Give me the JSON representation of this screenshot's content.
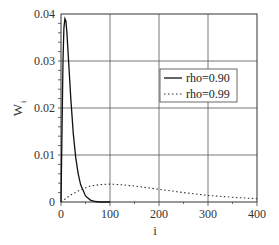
{
  "chart_data": {
    "type": "line",
    "title": "",
    "xlabel": "i",
    "ylabel": "W_i",
    "xlim": [
      0,
      400
    ],
    "ylim": [
      0,
      0.04
    ],
    "grid": true,
    "legend_position": "center-right",
    "x_ticks": [
      "0",
      "100",
      "200",
      "300",
      "400"
    ],
    "y_ticks": [
      "0",
      "0.01",
      "0.02",
      "0.03",
      "0.04"
    ],
    "series": [
      {
        "name": "rho=0.90",
        "style": "solid",
        "x": [
          0,
          2,
          4,
          6,
          8,
          10,
          12,
          15,
          20,
          25,
          30,
          35,
          40,
          50,
          60,
          70,
          80,
          90,
          100
        ],
        "values": [
          0.0,
          0.015,
          0.03,
          0.037,
          0.039,
          0.0385,
          0.036,
          0.031,
          0.022,
          0.0145,
          0.0095,
          0.006,
          0.0037,
          0.0013,
          0.0004,
          0.0001,
          0.0,
          0.0,
          0.0
        ]
      },
      {
        "name": "rho=0.99",
        "style": "dotted",
        "x": [
          0,
          20,
          40,
          60,
          80,
          100,
          120,
          150,
          200,
          250,
          300,
          350,
          400
        ],
        "values": [
          0.0,
          0.0015,
          0.0026,
          0.0034,
          0.0037,
          0.0038,
          0.0037,
          0.0034,
          0.0027,
          0.002,
          0.0014,
          0.001,
          0.0007
        ]
      }
    ]
  },
  "labels": {
    "y_axis": "W",
    "y_axis_sub": "i",
    "x_axis": "i",
    "legend_1": "rho=0.90",
    "legend_2": "rho=0.99",
    "xt0": "0",
    "xt1": "100",
    "xt2": "200",
    "xt3": "300",
    "xt4": "400",
    "yt0": "0",
    "yt1": "0.01",
    "yt2": "0.02",
    "yt3": "0.03",
    "yt4": "0.04"
  }
}
